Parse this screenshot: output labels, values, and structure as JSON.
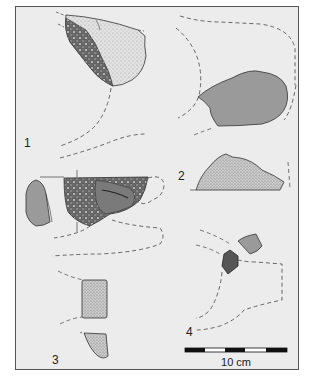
{
  "figure": {
    "type": "archaeological fragment illustration",
    "background": "#ececec",
    "border_color": "#555555",
    "fragments": [
      {
        "id": "1",
        "label": "1"
      },
      {
        "id": "2",
        "label": "2"
      },
      {
        "id": "3",
        "label": "3"
      },
      {
        "id": "4",
        "label": "4"
      }
    ],
    "scale_bar": {
      "label": "10 cm",
      "segments": [
        "black",
        "white",
        "black",
        "white",
        "black"
      ]
    },
    "colors": {
      "section_fill": "#9a9a9a",
      "stipple_fill": "#d8d8d8",
      "dark_texture": "#444444",
      "dashed_line": "#555555"
    }
  }
}
